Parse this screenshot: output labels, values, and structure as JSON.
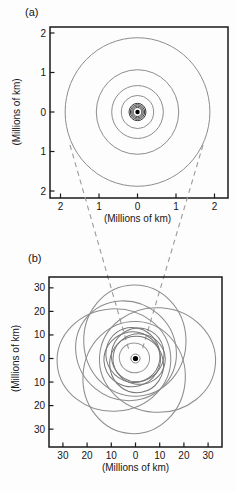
{
  "figure": {
    "panel_a_label": "(a)",
    "panel_b_label": "(b)"
  },
  "chart_data": [
    {
      "type": "line",
      "subtype": "orbit-diagram",
      "panel": "a",
      "title": "",
      "xlabel": "(Millions of km)",
      "ylabel": "(Millions of km)",
      "xlim": [
        -2.3,
        2.3
      ],
      "ylim": [
        -2.2,
        2.2
      ],
      "grid": false,
      "tick_values": [
        -2,
        -1,
        0,
        1,
        2
      ],
      "tick_labels": [
        "2",
        "1",
        "0",
        "1",
        "2"
      ],
      "central_dot": true,
      "units": "millions of km",
      "orbits": [
        {
          "a": 0.115,
          "e": 0,
          "rot": 0,
          "group": "inner"
        },
        {
          "a": 0.15,
          "e": 0,
          "rot": 0,
          "group": "inner"
        },
        {
          "a": 0.185,
          "e": 0,
          "rot": 0,
          "group": "inner"
        },
        {
          "a": 0.22,
          "e": 0,
          "rot": 0,
          "group": "inner"
        },
        {
          "a": 0.42,
          "e": 0,
          "rot": 0,
          "group": "galilean"
        },
        {
          "a": 0.67,
          "e": 0,
          "rot": 0,
          "group": "galilean"
        },
        {
          "a": 1.07,
          "e": 0,
          "rot": 0,
          "group": "galilean"
        },
        {
          "a": 1.88,
          "e": 0,
          "rot": 0,
          "group": "galilean"
        }
      ]
    },
    {
      "type": "line",
      "subtype": "orbit-diagram",
      "panel": "b",
      "title": "",
      "xlabel": "(Millions of km)",
      "ylabel": "(Millions of km)",
      "xlim": [
        -36,
        36
      ],
      "ylim": [
        -37,
        35
      ],
      "grid": false,
      "tick_values": [
        -30,
        -20,
        -10,
        0,
        10,
        20,
        30
      ],
      "tick_labels": [
        "30",
        "20",
        "10",
        "0",
        "10",
        "20",
        "30"
      ],
      "central_dot": true,
      "units": "millions of km",
      "orbits": [
        {
          "a": 1.9,
          "e": 0,
          "rot": 0,
          "group": "inset-extent"
        },
        {
          "a": 6.3,
          "e": 0.08,
          "rot": 150,
          "group": "themisto"
        },
        {
          "a": 11.2,
          "e": 0.16,
          "rot": 60,
          "group": "himalia"
        },
        {
          "a": 11.5,
          "e": 0.16,
          "rot": 125,
          "group": "himalia"
        },
        {
          "a": 11.7,
          "e": 0.12,
          "rot": 195,
          "group": "himalia"
        },
        {
          "a": 11.7,
          "e": 0.22,
          "rot": 280,
          "group": "himalia"
        },
        {
          "a": 10.8,
          "e": 0.14,
          "rot": 350,
          "group": "himalia"
        },
        {
          "a": 24.0,
          "e": 0.38,
          "rot": 356,
          "group": "outer"
        },
        {
          "a": 23.0,
          "e": 0.33,
          "rot": 92,
          "group": "outer"
        },
        {
          "a": 23.5,
          "e": 0.38,
          "rot": 184,
          "group": "outer"
        },
        {
          "a": 23.2,
          "e": 0.35,
          "rot": 266,
          "group": "outer"
        },
        {
          "a": 21.3,
          "e": 0.24,
          "rot": 140,
          "group": "outer"
        }
      ]
    }
  ]
}
